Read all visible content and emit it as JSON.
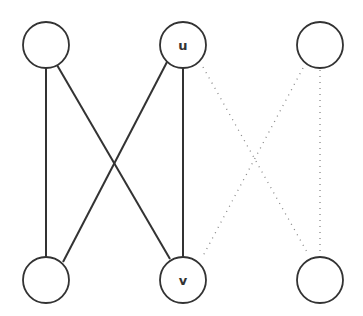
{
  "diagram": {
    "type": "bipartite-graph",
    "nodes": [
      {
        "id": "a",
        "label": "",
        "x": 46,
        "y": 45
      },
      {
        "id": "u",
        "label": "u",
        "x": 183,
        "y": 45
      },
      {
        "id": "c",
        "label": "",
        "x": 320,
        "y": 45
      },
      {
        "id": "d",
        "label": "",
        "x": 46,
        "y": 280
      },
      {
        "id": "v",
        "label": "v",
        "x": 183,
        "y": 280
      },
      {
        "id": "f",
        "label": "",
        "x": 320,
        "y": 280
      }
    ],
    "edges": [
      {
        "from": "a",
        "to": "d",
        "style": "solid"
      },
      {
        "from": "a",
        "to": "v",
        "style": "solid"
      },
      {
        "from": "u",
        "to": "d",
        "style": "solid"
      },
      {
        "from": "u",
        "to": "v",
        "style": "solid"
      },
      {
        "from": "u",
        "to": "f",
        "style": "dotted"
      },
      {
        "from": "c",
        "to": "v",
        "style": "dotted"
      },
      {
        "from": "c",
        "to": "f",
        "style": "dotted"
      }
    ],
    "colors": {
      "stroke": "#333333",
      "dotted": "#888888",
      "fill": "#ffffff"
    }
  }
}
